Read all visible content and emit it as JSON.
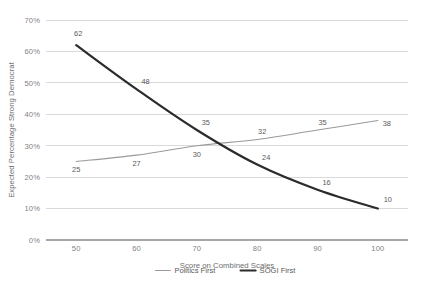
{
  "chart_data": {
    "type": "line",
    "title": "",
    "xlabel": "Score on Combined Scales",
    "ylabel": "Expected Percentage Strong Democrat",
    "x": [
      50,
      60,
      70,
      80,
      90,
      100
    ],
    "xtick_labels": [
      "50",
      "60",
      "70",
      "80",
      "90",
      "100"
    ],
    "ytick_labels": [
      "0%",
      "10%",
      "20%",
      "30%",
      "40%",
      "50%",
      "60%",
      "70%"
    ],
    "ytick_values": [
      0,
      10,
      20,
      30,
      40,
      50,
      60,
      70
    ],
    "xlim": [
      45,
      105
    ],
    "ylim": [
      0,
      70
    ],
    "grid": true,
    "legend_position": "bottom",
    "series": [
      {
        "name": "Politics First",
        "values": [
          25,
          27,
          30,
          32,
          35,
          38
        ],
        "labels": [
          "25",
          "27",
          "30",
          "32",
          "35",
          "38"
        ],
        "color": "#9a9a9a",
        "width": "thin"
      },
      {
        "name": "SOGI First",
        "values": [
          62,
          48,
          35,
          24,
          16,
          10
        ],
        "labels": [
          "62",
          "48",
          "35",
          "24",
          "16",
          "10"
        ],
        "color": "#2b2b2b",
        "width": "thick"
      }
    ]
  },
  "legend": {
    "items": [
      {
        "label": "Politics First",
        "color": "#9a9a9a",
        "width": "thin"
      },
      {
        "label": "SOGI First",
        "color": "#2b2b2b",
        "width": "thick"
      }
    ]
  },
  "axes": {
    "x_title": "Score on Combined Scales",
    "y_title": "Expected Percentage Strong Democrat"
  },
  "colors": {
    "background": "#ffffff",
    "gridline": "#d9d9d9",
    "axis": "#a6a6a6",
    "tick_text": "#7f7f7f",
    "label_text": "#595959",
    "series_politics": "#9a9a9a",
    "series_sogi": "#2b2b2b"
  }
}
